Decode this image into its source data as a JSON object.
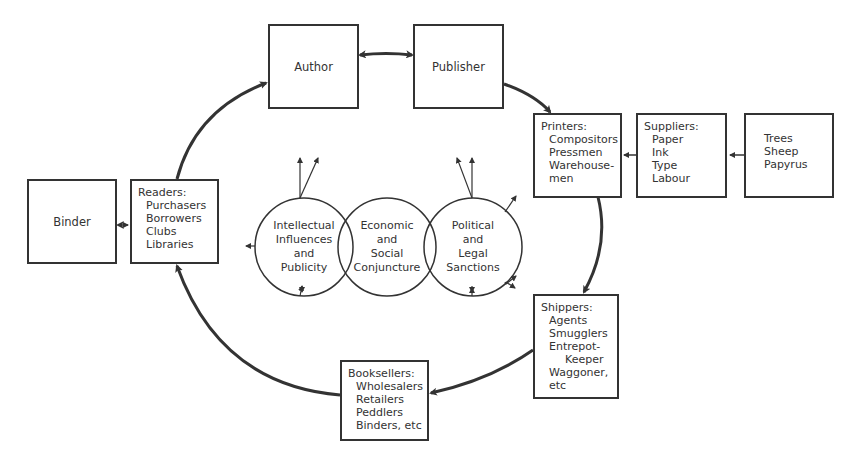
{
  "diagram": {
    "title": "",
    "nodes": {
      "author": {
        "label": "Author"
      },
      "publisher": {
        "label": "Publisher"
      },
      "printers": {
        "heading": "Printers:",
        "items": [
          "Compositors",
          "Pressmen",
          "Warehouse-",
          "men"
        ]
      },
      "suppliers": {
        "heading": "Suppliers:",
        "items": [
          "Paper",
          "Ink",
          "Type",
          "Labour"
        ]
      },
      "raw_materials": {
        "items": [
          "Trees",
          "Sheep",
          "Papyrus"
        ]
      },
      "binder": {
        "label": "Binder"
      },
      "readers": {
        "heading": "Readers:",
        "items": [
          "Purchasers",
          "Borrowers",
          "Clubs",
          "Libraries"
        ]
      },
      "shippers": {
        "heading": "Shippers:",
        "items": [
          "Agents",
          "Smugglers",
          "Entrepot-",
          "Keeper",
          "Waggoner,",
          "etc"
        ]
      },
      "booksellers": {
        "heading": "Booksellers:",
        "items": [
          "Wholesalers",
          "Retailers",
          "Peddlers",
          "Binders, etc"
        ]
      }
    },
    "circles": [
      {
        "lines": [
          "Intellectual",
          "Influences",
          "and",
          "Publicity"
        ]
      },
      {
        "lines": [
          "Economic",
          "and",
          "Social",
          "Conjuncture"
        ]
      },
      {
        "lines": [
          "Political",
          "and",
          "Legal",
          "Sanctions"
        ]
      }
    ],
    "edges": [
      {
        "from": "author",
        "to": "publisher",
        "type": "bidirectional"
      },
      {
        "from": "publisher",
        "to": "printers",
        "type": "curved"
      },
      {
        "from": "suppliers",
        "to": "printers",
        "type": "small-arrow"
      },
      {
        "from": "raw_materials",
        "to": "suppliers",
        "type": "small-arrow"
      },
      {
        "from": "printers",
        "to": "shippers",
        "type": "curved"
      },
      {
        "from": "shippers",
        "to": "booksellers",
        "type": "curved"
      },
      {
        "from": "booksellers",
        "to": "readers",
        "type": "curved"
      },
      {
        "from": "readers",
        "to": "author",
        "type": "curved"
      },
      {
        "from": "binder",
        "to": "readers",
        "type": "small-bidirectional"
      }
    ],
    "colors": {
      "stroke": "#333333",
      "background": "#ffffff"
    }
  }
}
